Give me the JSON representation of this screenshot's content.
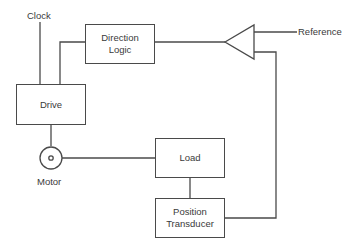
{
  "diagram": {
    "type": "servo-control block diagram",
    "colors": {
      "stroke": "#4a4a4a",
      "text": "#3a3a3a",
      "background": "#ffffff"
    },
    "nodes": {
      "clock": {
        "label": "Clock"
      },
      "direction_logic": {
        "label_line1": "Direction",
        "label_line2": "Logic"
      },
      "drive": {
        "label": "Drive"
      },
      "comparator": {
        "label": ""
      },
      "reference": {
        "label": "Reference"
      },
      "motor": {
        "label": "Motor"
      },
      "load": {
        "label": "Load"
      },
      "position_transducer": {
        "label_line1": "Position",
        "label_line2": "Transducer"
      }
    },
    "edges": [
      {
        "from": "clock",
        "to": "drive"
      },
      {
        "from": "direction_logic",
        "to": "drive"
      },
      {
        "from": "comparator",
        "to": "direction_logic"
      },
      {
        "from": "reference",
        "to": "comparator"
      },
      {
        "from": "position_transducer",
        "to": "comparator"
      },
      {
        "from": "drive",
        "to": "motor"
      },
      {
        "from": "motor",
        "to": "load"
      },
      {
        "from": "load",
        "to": "position_transducer"
      }
    ]
  }
}
